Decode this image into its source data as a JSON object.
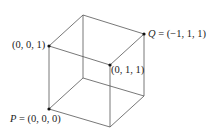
{
  "diagram": {
    "type": "cube-3d",
    "labels": {
      "P": "P",
      "P_eq": " = (0, 0, 0)",
      "Q": "Q",
      "Q_eq": " = (−1, 1, 1)",
      "v001": "(0, 0, 1)",
      "v011": "(0, 1, 1)"
    },
    "vertices": {
      "top_back": [
        83,
        15
      ],
      "Q": [
        144,
        34
      ],
      "v001": [
        49,
        46
      ],
      "v011": [
        110,
        65
      ],
      "P": [
        49,
        109
      ],
      "bottom_front": [
        110,
        127
      ],
      "bottom_right": [
        144,
        96
      ],
      "bottom_back": [
        83,
        78
      ]
    },
    "marked_points": [
      "P",
      "Q",
      "(0, 0, 1)",
      "(0, 1, 1)"
    ],
    "colors": {
      "edge": "#555555",
      "point": "#111111",
      "text": "#222222"
    }
  }
}
